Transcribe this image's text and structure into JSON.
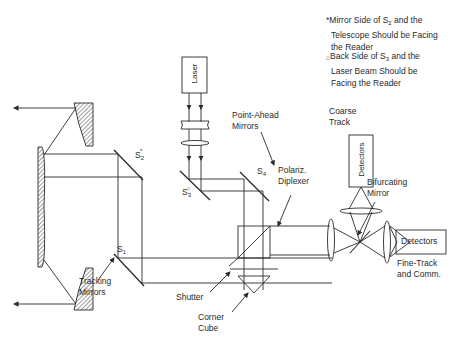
{
  "notes": {
    "mirror_side": {
      "marker": "*",
      "line1_pre": "Mirror Side of S",
      "line1_sub": "2",
      "line1_post": " and the",
      "line2": "Telescope Should be Facing",
      "line3": "the Reader"
    },
    "back_side": {
      "marker": "△",
      "line1_pre": "Back Side of S",
      "line1_sub": "3",
      "line1_post": " and the",
      "line2": "Laser Beam Should be",
      "line3": "Facing the Reader"
    }
  },
  "components": {
    "laser": "Laser",
    "coarse_detectors": "Detectors",
    "fine_detectors": "Detectors"
  },
  "labels": {
    "s1": {
      "base": "S",
      "sub": "1",
      "sup": ""
    },
    "s2": {
      "base": "S",
      "sub": "2",
      "sup": "*"
    },
    "s3": {
      "base": "S",
      "sub": "3",
      "sup": "△"
    },
    "s4": {
      "base": "S",
      "sub": "4",
      "sup": ""
    },
    "point_ahead": [
      "Point-Ahead",
      "Mirrors"
    ],
    "polariz": [
      "Polariz.",
      "Diplexer"
    ],
    "coarse_track": [
      "Coarse",
      "Track"
    ],
    "bifurcating": [
      "Bifurcating",
      "Mirror"
    ],
    "fine_track": [
      "Fine-Track",
      "and Comm."
    ],
    "tracking": [
      "Tracking",
      "Mirrors"
    ],
    "shutter": "Shutter",
    "corner_cube": [
      "Corner",
      "Cube"
    ]
  },
  "colors": {
    "line": "#2a2a2a",
    "background": "#ffffff"
  }
}
